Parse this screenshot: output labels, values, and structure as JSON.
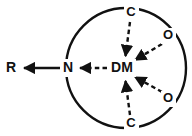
{
  "figure": {
    "type": "coordination-complex-diagram",
    "background_color": "#ffffff",
    "stroke_color": "#111111"
  },
  "sphere": {
    "name": "coordination-sphere",
    "center_x": 126,
    "center_y": 68,
    "radius": 60,
    "stroke_width": 2.4
  },
  "atoms": {
    "metal": {
      "label": "DM",
      "x": 122,
      "y": 68
    },
    "nitrogen": {
      "label": "N",
      "x": 68,
      "y": 68
    },
    "r_group": {
      "label": "R",
      "x": 11,
      "y": 68
    },
    "carbon_top": {
      "label": "C",
      "x": 131,
      "y": 13
    },
    "carbon_bottom": {
      "label": "C",
      "x": 131,
      "y": 124
    },
    "oxygen_top": {
      "label": "O",
      "x": 168,
      "y": 36
    },
    "oxygen_bottom": {
      "label": "O",
      "x": 168,
      "y": 99
    }
  },
  "bonds": [
    {
      "name": "bond-r-n",
      "from": "N",
      "to": "R",
      "style": "solid",
      "arrow": "single-left",
      "x1": 60,
      "y1": 68,
      "x2": 22,
      "y2": 68
    },
    {
      "name": "bond-dm-n",
      "from": "DM",
      "to": "N",
      "style": "dashed",
      "arrow": "single-left",
      "x1": 108,
      "y1": 68,
      "x2": 78,
      "y2": 68
    },
    {
      "name": "bond-ctop-dm",
      "from": "C",
      "to": "DM",
      "style": "dashed",
      "arrow": "single-to-metal",
      "x1": 130,
      "y1": 22,
      "x2": 125,
      "y2": 58
    },
    {
      "name": "bond-otop-dm",
      "from": "O",
      "to": "DM",
      "style": "dashed",
      "arrow": "single-to-metal",
      "x1": 161,
      "y1": 44,
      "x2": 133,
      "y2": 61
    },
    {
      "name": "bond-obottom-dm",
      "from": "O",
      "to": "DM",
      "style": "dashed",
      "arrow": "single-to-metal",
      "x1": 161,
      "y1": 92,
      "x2": 133,
      "y2": 76
    },
    {
      "name": "bond-cbottom-dm",
      "from": "C",
      "to": "DM",
      "style": "dashed",
      "arrow": "single-to-metal",
      "x1": 130,
      "y1": 115,
      "x2": 125,
      "y2": 79
    }
  ]
}
